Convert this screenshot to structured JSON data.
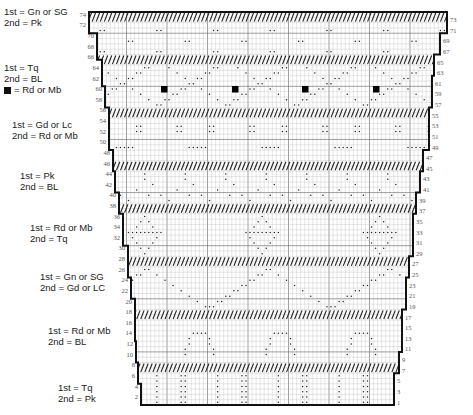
{
  "legend": [
    {
      "id": "band-1",
      "top": 6,
      "left": 4,
      "lines": [
        "1st = Gn or SG",
        "2nd = Pk"
      ]
    },
    {
      "id": "band-2",
      "top": 62,
      "left": 4,
      "lines": [
        "1st = Tq",
        "2nd = BL"
      ],
      "square_note": "= Rd or Mb"
    },
    {
      "id": "band-3",
      "top": 119,
      "left": 12,
      "lines": [
        "1st = Gd or Lc",
        "2nd = Rd or Mb"
      ]
    },
    {
      "id": "band-4",
      "top": 170,
      "left": 20,
      "lines": [
        "1st = Pk",
        "2nd = BL"
      ]
    },
    {
      "id": "band-5",
      "top": 222,
      "left": 30,
      "lines": [
        "1st = Rd or Mb",
        "2nd = Tq"
      ]
    },
    {
      "id": "band-6",
      "top": 271,
      "left": 40,
      "lines": [
        "1st = Gn or SG",
        "2nd = Gd or LC"
      ]
    },
    {
      "id": "band-7",
      "top": 325,
      "left": 48,
      "lines": [
        "1st = Rd or Mb",
        "2nd = BL"
      ]
    },
    {
      "id": "band-8",
      "top": 382,
      "left": 58,
      "lines": [
        "1st = Tq",
        "2nd = Pk"
      ]
    }
  ],
  "chart": {
    "rows": 74,
    "top_y": 12,
    "bottom_y": 405,
    "left_row_labels": [
      "74",
      "72",
      "70",
      "68",
      "66",
      "64",
      "62",
      "60",
      "58",
      "56",
      "54",
      "52",
      "50",
      "48",
      "46",
      "44",
      "42",
      "40",
      "38",
      "36",
      "34",
      "32",
      "30",
      "28",
      "26",
      "24",
      "22",
      "20",
      "18",
      "16",
      "14",
      "12",
      "10",
      "8",
      "6",
      "4",
      "2"
    ],
    "right_row_labels": [
      "73",
      "71",
      "69",
      "67",
      "65",
      "63",
      "61",
      "59",
      "57",
      "55",
      "53",
      "51",
      "49",
      "47",
      "45",
      "43",
      "41",
      "39",
      "37",
      "35",
      "33",
      "31",
      "29",
      "27",
      "25",
      "23",
      "21",
      "19",
      "17",
      "15",
      "13",
      "11",
      "9",
      "7",
      "5",
      "3",
      "1"
    ],
    "left_edge": [
      [
        71,
        74,
        89
      ],
      [
        66,
        70,
        97
      ],
      [
        61,
        65,
        102
      ],
      [
        57,
        60,
        105
      ],
      [
        49,
        56,
        109
      ],
      [
        45,
        48,
        113
      ],
      [
        41,
        44,
        115
      ],
      [
        37,
        40,
        119
      ],
      [
        31,
        36,
        123
      ],
      [
        25,
        30,
        128
      ],
      [
        21,
        24,
        131
      ],
      [
        13,
        20,
        135
      ],
      [
        9,
        12,
        136
      ],
      [
        5,
        8,
        138
      ],
      [
        1,
        4,
        141
      ]
    ],
    "right_edge": [
      [
        71,
        74,
        447
      ],
      [
        67,
        70,
        440
      ],
      [
        63,
        66,
        434
      ],
      [
        57,
        62,
        432
      ],
      [
        49,
        56,
        429
      ],
      [
        45,
        48,
        423
      ],
      [
        41,
        44,
        420
      ],
      [
        37,
        40,
        416
      ],
      [
        29,
        36,
        413
      ],
      [
        25,
        28,
        409
      ],
      [
        19,
        24,
        406
      ],
      [
        11,
        18,
        402
      ],
      [
        7,
        10,
        399
      ],
      [
        1,
        6,
        394
      ]
    ],
    "hatched_bands": [
      [
        73,
        74
      ],
      [
        65,
        66
      ],
      [
        55,
        56
      ],
      [
        45,
        46
      ],
      [
        37,
        38
      ],
      [
        27,
        28
      ],
      [
        17,
        18
      ],
      [
        7,
        8
      ]
    ],
    "square_markers": [
      {
        "row": 60,
        "x": 164
      },
      {
        "row": 60,
        "x": 235
      },
      {
        "row": 60,
        "x": 305
      },
      {
        "row": 60,
        "x": 376
      }
    ],
    "colors": {
      "grid_line": "#b8b8b8",
      "major_grid": "#777777",
      "outline": "#111111",
      "dot": "#222222",
      "hatch": "#222222"
    }
  }
}
